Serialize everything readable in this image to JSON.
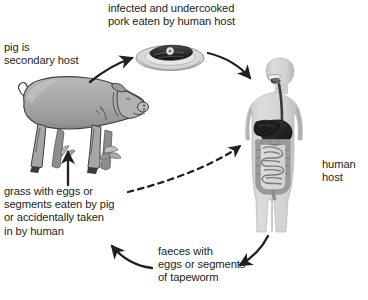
{
  "figure": {
    "type": "cycle-diagram"
  },
  "labels": {
    "pork": "infected and undercooked\npork eaten by human host",
    "pig": "pig is\nsecondary host",
    "human": "human\nhost",
    "grass": "grass with eggs or\nsegments eaten by pig\nor accidentally taken\nin by human",
    "faeces": "faeces with\neggs or segments\nof tapeworm",
    "caption": ""
  },
  "illustrations": {
    "pig": "pig-illustration",
    "human": "human-body-digestive-tract-illustration",
    "pork_plate": "plate-of-pork-illustration",
    "grass_eggs": "grass-with-eggs-illustration"
  },
  "arrows": [
    {
      "name": "pig-to-pork",
      "style": "solid",
      "from": "pig",
      "to": "pork-plate"
    },
    {
      "name": "pork-to-human",
      "style": "solid",
      "from": "pork-plate",
      "to": "human-host"
    },
    {
      "name": "human-to-faeces",
      "style": "solid",
      "from": "human-host",
      "to": "faeces"
    },
    {
      "name": "faeces-to-grass",
      "style": "solid",
      "from": "faeces",
      "to": "grass"
    },
    {
      "name": "grass-to-pig",
      "style": "solid",
      "from": "grass",
      "to": "pig"
    },
    {
      "name": "grass-to-human",
      "style": "dashed",
      "from": "grass",
      "to": "human-host"
    }
  ],
  "colors": {
    "background": "#ffffff",
    "text": "#231f20",
    "arrow": "#231f20",
    "pig_body": "#a9a9a9",
    "pig_shade": "#8d8d8d",
    "pig_outline": "#3a3a3a",
    "human_body": "#cfcfcf",
    "human_shade": "#b4b4b4",
    "organ_dark": "#2b2b2b",
    "organ_light": "#e2e2e2",
    "plate": "#d9d9d9",
    "meat_dark": "#2e2e2e"
  }
}
